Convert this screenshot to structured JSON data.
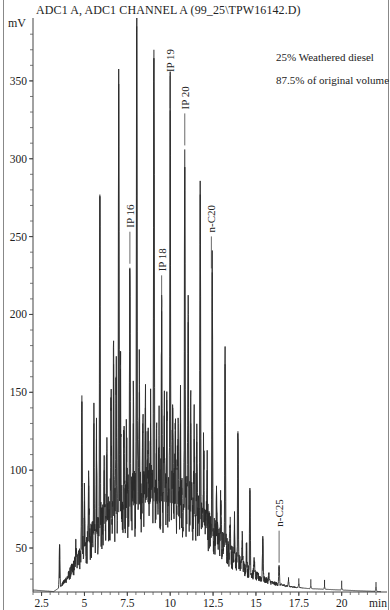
{
  "chart_data": {
    "type": "line",
    "title": "ADC1 A, ADC1 CHANNEL A (99_25\\TPW16142.D)",
    "xlabel": "min",
    "ylabel": "mV",
    "xlim": [
      2.0,
      22.3
    ],
    "ylim": [
      21,
      385
    ],
    "x_ticks": [
      2.5,
      5,
      7.5,
      10,
      12.5,
      15,
      17.5,
      20
    ],
    "x_tick_labels": [
      "2.5",
      "5",
      "7.5",
      "10",
      "12.5",
      "15",
      "17.5",
      "20"
    ],
    "y_ticks": [
      50,
      100,
      150,
      200,
      250,
      300,
      350
    ],
    "y_tick_labels": [
      "50",
      "100",
      "150",
      "200",
      "250",
      "300",
      "350"
    ],
    "grid": false,
    "legend": null,
    "notes": [
      "25% Weathered diesel",
      "87.5% of original volume"
    ],
    "annotations": [
      {
        "label": "IP 16",
        "x": 7.65,
        "y": 230
      },
      {
        "label": "IP 18",
        "x": 9.5,
        "y": 202
      },
      {
        "label": "IP 19",
        "x": 10.0,
        "y": 330
      },
      {
        "label": "IP 20",
        "x": 10.85,
        "y": 306
      },
      {
        "label": "n-C20",
        "x": 12.4,
        "y": 227
      },
      {
        "label": "n-C25",
        "x": 16.35,
        "y": 38
      }
    ],
    "baseline_hump": [
      [
        2.0,
        23
      ],
      [
        3.2,
        22
      ],
      [
        3.6,
        25
      ],
      [
        4.0,
        30
      ],
      [
        4.5,
        38
      ],
      [
        5.0,
        45
      ],
      [
        5.5,
        52
      ],
      [
        6.0,
        58
      ],
      [
        6.5,
        63
      ],
      [
        7.0,
        67
      ],
      [
        7.5,
        70
      ],
      [
        8.0,
        72
      ],
      [
        8.5,
        73
      ],
      [
        9.0,
        74
      ],
      [
        9.5,
        74
      ],
      [
        10.0,
        73
      ],
      [
        10.5,
        72
      ],
      [
        11.0,
        69
      ],
      [
        11.5,
        65
      ],
      [
        12.0,
        60
      ],
      [
        12.5,
        54
      ],
      [
        13.0,
        48
      ],
      [
        13.5,
        43
      ],
      [
        14.0,
        38
      ],
      [
        14.5,
        34
      ],
      [
        15.0,
        31
      ],
      [
        15.5,
        29
      ],
      [
        16.0,
        27
      ],
      [
        16.5,
        26
      ],
      [
        17.0,
        25
      ],
      [
        18.0,
        24
      ],
      [
        19.0,
        23.5
      ],
      [
        20.0,
        23
      ],
      [
        21.0,
        22.5
      ],
      [
        22.3,
        22
      ]
    ],
    "peaks": [
      {
        "t": 3.55,
        "mV": 52
      },
      {
        "t": 4.5,
        "mV": 50
      },
      {
        "t": 4.65,
        "mV": 47
      },
      {
        "t": 4.85,
        "mV": 148
      },
      {
        "t": 5.0,
        "mV": 80
      },
      {
        "t": 5.25,
        "mV": 90
      },
      {
        "t": 5.55,
        "mV": 130
      },
      {
        "t": 5.7,
        "mV": 120
      },
      {
        "t": 5.9,
        "mV": 277
      },
      {
        "t": 6.15,
        "mV": 100
      },
      {
        "t": 6.3,
        "mV": 110
      },
      {
        "t": 6.55,
        "mV": 140
      },
      {
        "t": 6.7,
        "mV": 168
      },
      {
        "t": 6.85,
        "mV": 160
      },
      {
        "t": 7.0,
        "mV": 348
      },
      {
        "t": 7.1,
        "mV": 165
      },
      {
        "t": 7.3,
        "mV": 125
      },
      {
        "t": 7.45,
        "mV": 115
      },
      {
        "t": 7.65,
        "mV": 230
      },
      {
        "t": 7.85,
        "mV": 130
      },
      {
        "t": 8.05,
        "mV": 385
      },
      {
        "t": 8.2,
        "mV": 150
      },
      {
        "t": 8.4,
        "mV": 130
      },
      {
        "t": 8.55,
        "mV": 140
      },
      {
        "t": 8.7,
        "mV": 125
      },
      {
        "t": 8.85,
        "mV": 130
      },
      {
        "t": 9.05,
        "mV": 370
      },
      {
        "t": 9.2,
        "mV": 120
      },
      {
        "t": 9.35,
        "mV": 115
      },
      {
        "t": 9.5,
        "mV": 202
      },
      {
        "t": 9.65,
        "mV": 135
      },
      {
        "t": 9.8,
        "mV": 145
      },
      {
        "t": 10.0,
        "mV": 331
      },
      {
        "t": 10.15,
        "mV": 140
      },
      {
        "t": 10.3,
        "mV": 125
      },
      {
        "t": 10.45,
        "mV": 120
      },
      {
        "t": 10.6,
        "mV": 130
      },
      {
        "t": 10.85,
        "mV": 306
      },
      {
        "t": 11.05,
        "mV": 195
      },
      {
        "t": 11.2,
        "mV": 130
      },
      {
        "t": 11.4,
        "mV": 120
      },
      {
        "t": 11.55,
        "mV": 118
      },
      {
        "t": 11.75,
        "mV": 277
      },
      {
        "t": 11.95,
        "mV": 110
      },
      {
        "t": 12.15,
        "mV": 100
      },
      {
        "t": 12.45,
        "mV": 227
      },
      {
        "t": 12.7,
        "mV": 90
      },
      {
        "t": 12.95,
        "mV": 78
      },
      {
        "t": 13.2,
        "mV": 168
      },
      {
        "t": 13.5,
        "mV": 70
      },
      {
        "t": 13.75,
        "mV": 65
      },
      {
        "t": 13.95,
        "mV": 125
      },
      {
        "t": 14.2,
        "mV": 55
      },
      {
        "t": 14.45,
        "mV": 50
      },
      {
        "t": 14.65,
        "mV": 87
      },
      {
        "t": 14.9,
        "mV": 42
      },
      {
        "t": 15.4,
        "mV": 56
      },
      {
        "t": 15.75,
        "mV": 33
      },
      {
        "t": 16.35,
        "mV": 38
      },
      {
        "t": 16.9,
        "mV": 29
      },
      {
        "t": 17.5,
        "mV": 27
      },
      {
        "t": 18.2,
        "mV": 25.5
      },
      {
        "t": 19.0,
        "mV": 25
      },
      {
        "t": 20.0,
        "mV": 24.5
      },
      {
        "t": 22.0,
        "mV": 25
      }
    ]
  }
}
